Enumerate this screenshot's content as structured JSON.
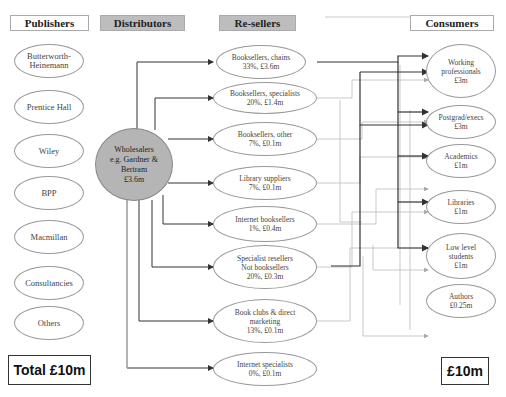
{
  "headers": {
    "publishers": "Publishers",
    "distributors": "Distributors",
    "resellers": "Re-sellers",
    "consumers": "Consumers"
  },
  "publishers": [
    {
      "line1": "Butterworth-",
      "line2": "Heinemann"
    },
    {
      "line1": "Prentice Hall",
      "line2": ""
    },
    {
      "line1": "Wiley",
      "line2": ""
    },
    {
      "line1": "BPP",
      "line2": ""
    },
    {
      "line1": "Macmillan",
      "line2": ""
    },
    {
      "line1": "Consultancies",
      "line2": ""
    },
    {
      "line1": "Others",
      "line2": ""
    }
  ],
  "distributor": {
    "line1": "Wholesalers",
    "line2": "e.g. Gardner & Bertram",
    "line3": "£3.6m"
  },
  "resellers": [
    {
      "line1": "Booksellers, chains",
      "line2": "33%, £3.6m",
      "line3": ""
    },
    {
      "line1": "Booksellers, specialists",
      "line2": "20%, £1.4m",
      "line3": ""
    },
    {
      "line1": "Booksellers, other",
      "line2": "7%, £0.1m",
      "line3": ""
    },
    {
      "line1": "Library suppliers",
      "line2": "7%, £0.1m",
      "line3": ""
    },
    {
      "line1": "Internet booksellers",
      "line2": "1%, £0.4m",
      "line3": ""
    },
    {
      "line1": "Specialist resellers",
      "line2": "Not booksellers",
      "line3": "20%, £0.3m"
    },
    {
      "line1": "Book clubs & direct",
      "line2": "marketing",
      "line3": "13%, £0.1m"
    },
    {
      "line1": "Internet specialists",
      "line2": "0%, £0.1m",
      "line3": ""
    }
  ],
  "consumers": [
    {
      "line1": "Working",
      "line2": "professionals",
      "line3": "£3m"
    },
    {
      "line1": "Postgrad/execs",
      "line2": "£3m",
      "line3": ""
    },
    {
      "line1": "Academics",
      "line2": "£1m",
      "line3": ""
    },
    {
      "line1": "Libraries",
      "line2": "£1m",
      "line3": ""
    },
    {
      "line1": "Low level",
      "line2": "students",
      "line3": "£1m"
    },
    {
      "line1": "Authors",
      "line2": "£0.25m",
      "line3": ""
    }
  ],
  "totals": {
    "left": "Total £10m",
    "right": "£10m"
  },
  "colors": {
    "header_grey": "#bdbdbd",
    "wholesaler_fill": "#b5b5b5",
    "arrow_dark": "#333333",
    "arrow_light": "#aaaaaa"
  }
}
